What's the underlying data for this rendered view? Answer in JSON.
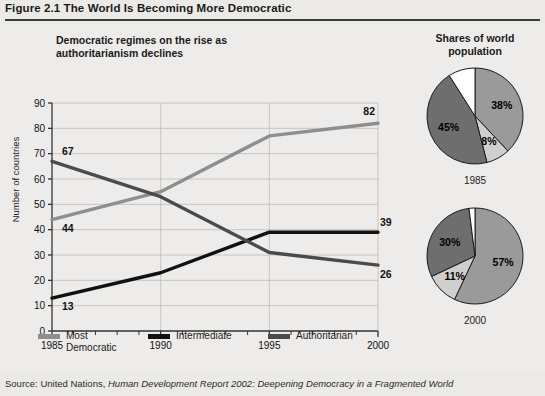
{
  "figure": {
    "number_label": "Figure 2.1",
    "title": "The World Is Becoming More Democratic",
    "full_title": "Figure 2.1  The World Is Becoming More Democratic"
  },
  "source": {
    "prefix": "Source: United Nations,",
    "italic": "Human Development Report 2002: Deepening Democracy in a Fragmented World"
  },
  "colors": {
    "most_democratic": "#8e8e8e",
    "intermediate": "#111111",
    "authoritarian": "#4b4b4b",
    "pie_medium": "#9a9a9a",
    "pie_light": "#cfcfcf",
    "pie_dark": "#6e6e6e",
    "pie_white": "#ffffff",
    "background": "#eceae7",
    "rule": "#3a3a3a"
  },
  "chart_data": [
    {
      "type": "line",
      "title": "Democratic regimes on the rise as authoritarianism declines",
      "xlabel": "",
      "ylabel": "Number of countries",
      "xlim": [
        1985,
        2000
      ],
      "ylim": [
        0,
        90
      ],
      "ytick_step": 10,
      "yticks": [
        0,
        10,
        20,
        30,
        40,
        50,
        60,
        70,
        80,
        90
      ],
      "xticks_major": [
        1985,
        1990,
        1995,
        2000
      ],
      "xticks_minor": [
        1986,
        1987,
        1988,
        1989,
        1991,
        1992,
        1993,
        1994,
        1996,
        1997,
        1998,
        1999
      ],
      "grid": "horizontal-and-major-vertical",
      "legend_position": "below",
      "x": [
        1985,
        1990,
        1995,
        2000
      ],
      "series": [
        {
          "name": "Most Democratic",
          "color": "#8e8e8e",
          "values": [
            44,
            55,
            77,
            82
          ],
          "start_label": "44",
          "end_label": "82"
        },
        {
          "name": "Intermediate",
          "color": "#111111",
          "values": [
            13,
            23,
            39,
            39
          ],
          "start_label": "13",
          "end_label": "39"
        },
        {
          "name": "Authoritarian",
          "color": "#4b4b4b",
          "values": [
            67,
            53,
            31,
            26
          ],
          "start_label": "67",
          "end_label": "26"
        }
      ]
    },
    {
      "type": "pie",
      "title": "Shares of world population",
      "year": "1985",
      "labels": [
        "38%",
        "8%",
        "45%",
        ""
      ],
      "values": [
        38,
        8,
        45,
        9
      ],
      "colors": [
        "#9a9a9a",
        "#cfcfcf",
        "#6e6e6e",
        "#ffffff"
      ],
      "start_angle_deg": 0
    },
    {
      "type": "pie",
      "title": "Shares of world population",
      "year": "2000",
      "labels": [
        "57%",
        "11%",
        "30%",
        ""
      ],
      "values": [
        57,
        11,
        30,
        2
      ],
      "colors": [
        "#9a9a9a",
        "#cfcfcf",
        "#6e6e6e",
        "#ffffff"
      ],
      "start_angle_deg": 0
    }
  ],
  "line_chart": {
    "title_line1": "Democratic regimes on the rise as",
    "title_line2": "authoritarianism declines",
    "ylabel": "Number of countries",
    "ytick_labels": [
      "90",
      "80",
      "70",
      "60",
      "50",
      "40",
      "30",
      "20",
      "10",
      "0"
    ],
    "xtick_labels": [
      "1985",
      "1990",
      "1995",
      "2000"
    ],
    "annotations": {
      "most_dem_start": "44",
      "most_dem_end": "82",
      "intermediate_start": "13",
      "intermediate_end": "39",
      "auth_start": "67",
      "auth_end": "26"
    },
    "legend": [
      {
        "label": "Most Democratic",
        "color": "#8e8e8e"
      },
      {
        "label": "Intermediate",
        "color": "#111111"
      },
      {
        "label": "Authoritarian",
        "color": "#4b4b4b"
      }
    ]
  },
  "pie_panel": {
    "title_line1": "Shares of world",
    "title_line2": "population",
    "pies": [
      {
        "year": "1985",
        "slices": [
          {
            "label": "38%",
            "value": 38,
            "color": "#9a9a9a"
          },
          {
            "label": "8%",
            "value": 8,
            "color": "#cfcfcf"
          },
          {
            "label": "45%",
            "value": 45,
            "color": "#6e6e6e"
          },
          {
            "label": "",
            "value": 9,
            "color": "#ffffff"
          }
        ]
      },
      {
        "year": "2000",
        "slices": [
          {
            "label": "57%",
            "value": 57,
            "color": "#9a9a9a"
          },
          {
            "label": "11%",
            "value": 11,
            "color": "#cfcfcf"
          },
          {
            "label": "30%",
            "value": 30,
            "color": "#6e6e6e"
          },
          {
            "label": "",
            "value": 2,
            "color": "#ffffff"
          }
        ]
      }
    ]
  }
}
